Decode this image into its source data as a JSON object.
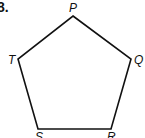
{
  "problem": {
    "number": "8."
  },
  "figure": {
    "shape": "pentagon",
    "stroke_color": "#111111",
    "vertices": [
      {
        "label": "P",
        "x": 73,
        "y": 16
      },
      {
        "label": "Q",
        "x": 131,
        "y": 59
      },
      {
        "label": "R",
        "x": 111,
        "y": 129
      },
      {
        "label": "S",
        "x": 38,
        "y": 129
      },
      {
        "label": "T",
        "x": 18,
        "y": 59
      }
    ]
  },
  "labels": {
    "P": "P",
    "Q": "Q",
    "R": "R",
    "S": "S",
    "T": "T"
  }
}
